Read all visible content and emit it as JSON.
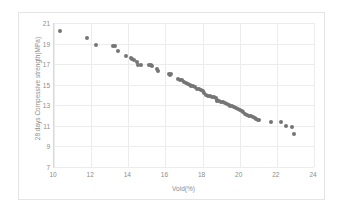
{
  "chart_data": {
    "type": "scatter",
    "title": "",
    "xlabel": "Void(%)",
    "ylabel": "28 days Compessive strength(MPa)",
    "xlim": [
      10,
      24
    ],
    "ylim": [
      7,
      21
    ],
    "xticks": [
      10,
      12,
      14,
      16,
      18,
      20,
      22,
      24
    ],
    "yticks": [
      7,
      9,
      11,
      13,
      15,
      17,
      19,
      21
    ],
    "grid": true,
    "legend": null,
    "marker_color": "#757575",
    "gridline_color": "#ececec",
    "axis_color": "#d9d9d9",
    "tick_label_color": "#8c8c8c",
    "points": [
      [
        10.3,
        20.2
      ],
      [
        11.75,
        19.5
      ],
      [
        12.25,
        18.9
      ],
      [
        13.2,
        18.8
      ],
      [
        13.3,
        18.75
      ],
      [
        13.45,
        18.25
      ],
      [
        13.9,
        17.75
      ],
      [
        14.15,
        17.6
      ],
      [
        14.2,
        17.5
      ],
      [
        14.3,
        17.4
      ],
      [
        14.45,
        17.25
      ],
      [
        14.5,
        16.95
      ],
      [
        14.7,
        16.9
      ],
      [
        15.1,
        16.9
      ],
      [
        15.2,
        16.95
      ],
      [
        15.3,
        16.85
      ],
      [
        15.55,
        16.5
      ],
      [
        15.6,
        16.35
      ],
      [
        16.2,
        16.0
      ],
      [
        16.25,
        15.9
      ],
      [
        16.3,
        16.05
      ],
      [
        16.7,
        15.6
      ],
      [
        16.8,
        15.5
      ],
      [
        16.9,
        15.45
      ],
      [
        17.0,
        15.3
      ],
      [
        17.1,
        15.2
      ],
      [
        17.2,
        15.1
      ],
      [
        17.3,
        15.0
      ],
      [
        17.4,
        14.9
      ],
      [
        17.5,
        14.85
      ],
      [
        17.6,
        14.75
      ],
      [
        17.7,
        14.6
      ],
      [
        17.8,
        14.55
      ],
      [
        17.9,
        14.45
      ],
      [
        18.0,
        14.35
      ],
      [
        18.1,
        14.2
      ],
      [
        18.2,
        14.0
      ],
      [
        18.3,
        13.95
      ],
      [
        18.4,
        13.9
      ],
      [
        18.5,
        13.85
      ],
      [
        18.6,
        13.8
      ],
      [
        18.7,
        13.75
      ],
      [
        18.75,
        13.5
      ],
      [
        18.8,
        13.45
      ],
      [
        18.9,
        13.4
      ],
      [
        19.0,
        13.35
      ],
      [
        19.1,
        13.3
      ],
      [
        19.2,
        13.2
      ],
      [
        19.3,
        13.1
      ],
      [
        19.4,
        13.05
      ],
      [
        19.5,
        12.95
      ],
      [
        19.6,
        12.9
      ],
      [
        19.7,
        12.8
      ],
      [
        19.8,
        12.7
      ],
      [
        19.9,
        12.6
      ],
      [
        20.0,
        12.5
      ],
      [
        20.1,
        12.4
      ],
      [
        20.2,
        12.3
      ],
      [
        20.3,
        12.2
      ],
      [
        20.4,
        12.1
      ],
      [
        20.5,
        12.0
      ],
      [
        20.6,
        11.95
      ],
      [
        20.7,
        11.85
      ],
      [
        20.8,
        11.75
      ],
      [
        20.9,
        11.7
      ],
      [
        21.0,
        11.6
      ],
      [
        21.05,
        11.55
      ],
      [
        21.7,
        11.4
      ],
      [
        22.2,
        11.4
      ],
      [
        22.5,
        10.95
      ],
      [
        22.8,
        10.9
      ],
      [
        22.9,
        10.2
      ]
    ]
  }
}
